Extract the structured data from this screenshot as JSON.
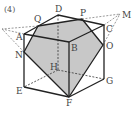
{
  "problem_number": "(4)",
  "labels": {
    "A": "A",
    "B": "B",
    "C": "C",
    "D": "D",
    "E": "E",
    "F": "F",
    "G": "G",
    "H": "H",
    "M": "M",
    "N": "N",
    "O": "O",
    "P": "P",
    "Q": "Q"
  },
  "colors": {
    "section_fill": "#c8c8c8",
    "edge": "#222222"
  }
}
